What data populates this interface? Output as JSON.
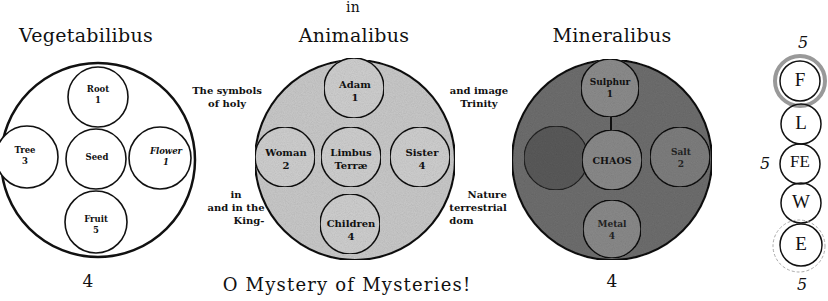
{
  "header": {
    "top_word": "in"
  },
  "diagrams": [
    {
      "title": "Vegetabilibus",
      "fill": "#ffffff",
      "bottom_number": "4",
      "center": {
        "label": "Seed",
        "number": ""
      },
      "top": {
        "label": "Root",
        "number": "1"
      },
      "left": {
        "label": "Tree",
        "number": "3"
      },
      "right": {
        "label": "Flower",
        "number": "1"
      },
      "bottom": {
        "label": "Fruit",
        "number": "5"
      }
    },
    {
      "title": "Animalibus",
      "fill": "#c9c9c9",
      "bottom_number": "",
      "center": {
        "label": "Limbus",
        "number": "Terræ"
      },
      "top": {
        "label": "Adam",
        "number": "1"
      },
      "left": {
        "label": "Woman",
        "number": "2"
      },
      "right": {
        "label": "Sister",
        "number": "4"
      },
      "bottom": {
        "label": "Children",
        "number": "4"
      }
    },
    {
      "title": "Mineralibus",
      "fill": "#6e6e6e",
      "bottom_number": "4",
      "center": {
        "label": "CHAOS",
        "number": ""
      },
      "top": {
        "label": "Sulphur",
        "number": "1"
      },
      "left": {
        "label": "",
        "number": ""
      },
      "right": {
        "label": "Salt",
        "number": "2"
      },
      "bottom": {
        "label": "Metal",
        "number": "4"
      }
    }
  ],
  "side_text": {
    "left_top": [
      "The symbols",
      "of holy"
    ],
    "left_bottom": [
      "in",
      "and in the",
      "King-"
    ],
    "right_top": [
      "and image",
      "Trinity"
    ],
    "right_bottom": [
      "Nature",
      "terrestrial",
      "dom"
    ]
  },
  "caption": "O Mystery of Mysteries!",
  "elements_column": {
    "top_number": "5",
    "side_number": "5",
    "bottom_number": "5",
    "letters": [
      "F",
      "L",
      "FE",
      "W",
      "E"
    ]
  },
  "colors": {
    "ink": "#111111",
    "animal_fill": "#c9c9c9",
    "mineral_fill": "#6e6e6e",
    "mineral_inner": "#8a8a8a"
  }
}
